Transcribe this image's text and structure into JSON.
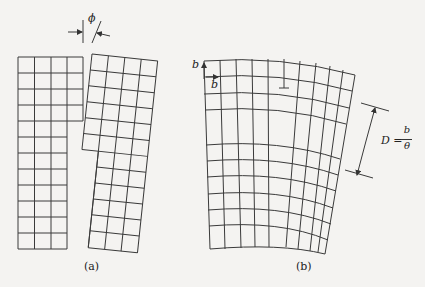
{
  "figure": {
    "panels": [
      {
        "id": "a",
        "label": "(a)",
        "description": "Tilted crystal blocks forming a low-angle boundary"
      },
      {
        "id": "b",
        "label": "(b)",
        "description": "Bent lattice with edge dislocation array"
      }
    ],
    "annotations": {
      "tilt_angle_symbol": "ϕ",
      "burgers_vertical": "b",
      "burgers_horizontal": "b",
      "dislocation_symbol": "⊥",
      "spacing_lhs": "D =",
      "spacing_num": "b",
      "spacing_den": "θ"
    },
    "colors": {
      "line": "#3a3a3a",
      "background": "#f4f3f1"
    }
  }
}
